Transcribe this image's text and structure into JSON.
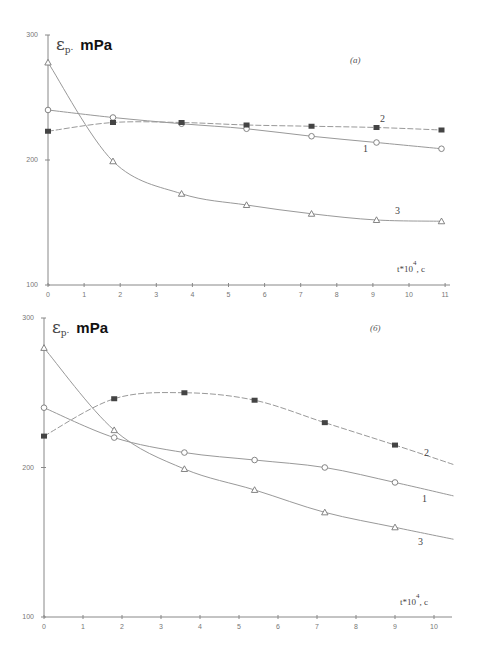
{
  "chart_data": [
    {
      "type": "line",
      "panel_label": "(a)",
      "title": "",
      "ylabel_symbol": "ε",
      "ylabel_subscript": "p",
      "ylabel_unit": "mPa",
      "ylabel": "εp, mPa",
      "xlabel": "t*10^4, c",
      "xlabel_main": "t*10",
      "xlabel_exp": "4",
      "xlabel_tail": ", c",
      "ylim": [
        100,
        300
      ],
      "xlim": [
        0,
        11
      ],
      "yticks": [
        "100",
        "200",
        "300"
      ],
      "xticks": [
        "0",
        "1",
        "2",
        "3",
        "4",
        "5",
        "6",
        "7",
        "8",
        "9",
        "10",
        "11"
      ],
      "grid": false,
      "series": [
        {
          "name": "1",
          "marker": "circle-open",
          "x": [
            0,
            1.8,
            3.7,
            5.5,
            7.3,
            9.1,
            10.9
          ],
          "values": [
            240,
            234,
            229,
            225,
            219,
            214,
            209
          ]
        },
        {
          "name": "2",
          "marker": "square-filled",
          "x": [
            0,
            1.8,
            3.7,
            5.5,
            7.3,
            9.1,
            10.9
          ],
          "values": [
            223,
            230,
            230,
            228,
            227,
            226,
            224
          ]
        },
        {
          "name": "3",
          "marker": "triangle-open",
          "x": [
            0,
            1.8,
            3.7,
            5.5,
            7.3,
            9.1,
            10.9
          ],
          "values": [
            278,
            199,
            173,
            164,
            157,
            152,
            151
          ]
        }
      ]
    },
    {
      "type": "line",
      "panel_label": "(б)",
      "title": "",
      "ylabel_symbol": "ε",
      "ylabel_subscript": "p",
      "ylabel_unit": "mPa",
      "ylabel": "εp, mPa",
      "xlabel": "t*10^4, c",
      "xlabel_main": "t*10",
      "xlabel_exp": "4",
      "xlabel_tail": ", c",
      "ylim": [
        100,
        300
      ],
      "xlim": [
        0,
        10.5
      ],
      "yticks": [
        "100",
        "200",
        "300"
      ],
      "xticks": [
        "0",
        "1",
        "2",
        "3",
        "4",
        "5",
        "6",
        "7",
        "8",
        "9",
        "10"
      ],
      "grid": false,
      "series": [
        {
          "name": "1",
          "marker": "circle-open",
          "x": [
            0,
            1.8,
            3.6,
            5.4,
            7.2,
            9.0,
            10.5
          ],
          "values": [
            240,
            220,
            210,
            205,
            200,
            190,
            181
          ]
        },
        {
          "name": "2",
          "marker": "square-filled",
          "x": [
            0,
            1.8,
            3.6,
            5.4,
            7.2,
            9.0,
            10.5
          ],
          "values": [
            221,
            246,
            250,
            245,
            230,
            215,
            202
          ]
        },
        {
          "name": "3",
          "marker": "triangle-open",
          "x": [
            0,
            1.8,
            3.6,
            5.4,
            7.2,
            9.0,
            10.5
          ],
          "values": [
            280,
            225,
            199,
            185,
            170,
            160,
            152
          ]
        }
      ]
    }
  ]
}
